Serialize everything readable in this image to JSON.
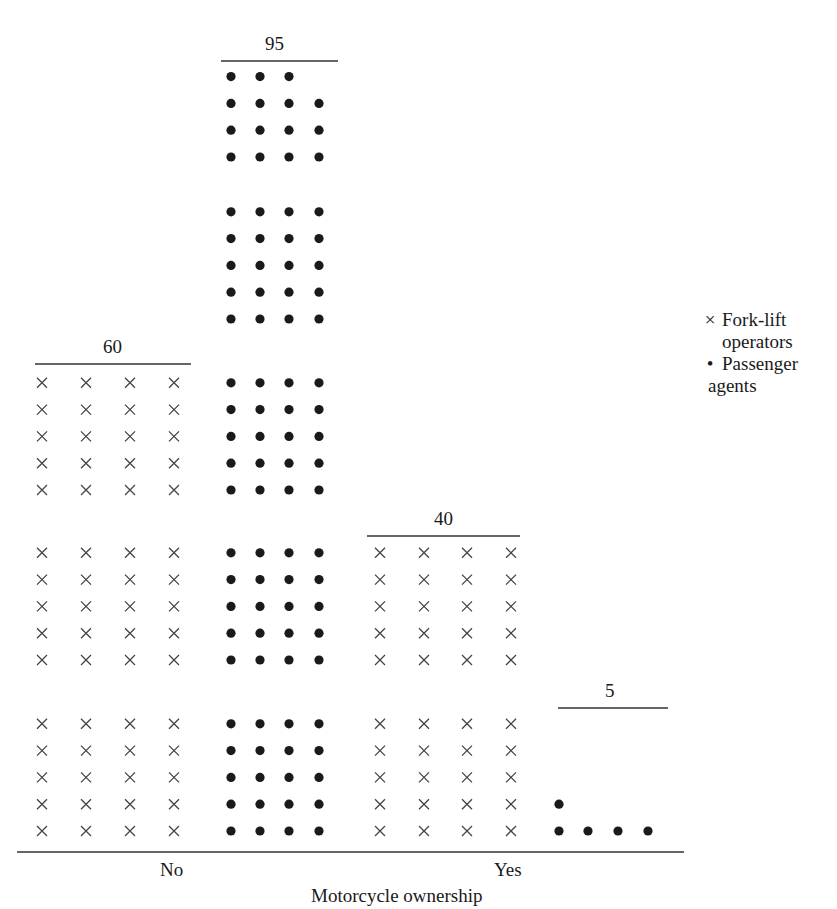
{
  "chart_data": {
    "type": "bar",
    "subtype": "pictogram / dot-stack chart",
    "title": "",
    "xlabel": "Motorcycle ownership",
    "ylabel": "",
    "categories": [
      "No",
      "Yes"
    ],
    "series": [
      {
        "name": "Fork-lift operators",
        "marker": "×",
        "values": [
          60,
          40
        ]
      },
      {
        "name": "Passenger agents",
        "marker": "•",
        "values": [
          95,
          5
        ]
      }
    ],
    "bar_labels": [
      {
        "category": "No",
        "series": "Fork-lift operators",
        "label": "60"
      },
      {
        "category": "No",
        "series": "Passenger agents",
        "label": "95"
      },
      {
        "category": "Yes",
        "series": "Fork-lift operators",
        "label": "40"
      },
      {
        "category": "Yes",
        "series": "Passenger agents",
        "label": "5"
      }
    ],
    "units_per_marker": 1,
    "markers_per_row": 4,
    "rows_per_block": 5,
    "legend_position": "right",
    "grid": false
  },
  "labels": {
    "x_axis_title": "Motorcycle ownership",
    "category_no": "No",
    "category_yes": "Yes",
    "total_no_forklift": "60",
    "total_no_passenger": "95",
    "total_yes_forklift": "40",
    "total_yes_passenger": "5"
  },
  "legend": {
    "items": [
      {
        "symbol": "×",
        "line1": "Fork-lift",
        "line2": "operators"
      },
      {
        "symbol": "•",
        "line1": "Passenger",
        "line2": "agents"
      }
    ]
  },
  "colors": {
    "ink": "#1a1a1a",
    "cross": "#444444",
    "background": "#ffffff"
  }
}
